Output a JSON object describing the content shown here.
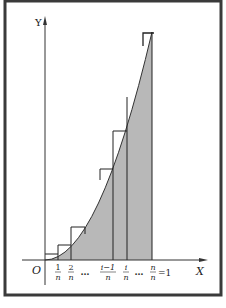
{
  "figure": {
    "axes": {
      "x_label": "X",
      "y_label": "Y",
      "origin_label": "O"
    },
    "ticks": [
      {
        "num": "1",
        "den": "n"
      },
      {
        "num": "2",
        "den": "n"
      },
      {
        "ellipsis": "…"
      },
      {
        "num": "i−1",
        "den": "n"
      },
      {
        "num": "i",
        "den": "n"
      },
      {
        "ellipsis": "…"
      },
      {
        "num": "n",
        "den": "n",
        "suffix": "=1"
      }
    ],
    "colors": {
      "border": "#3a3a3a",
      "shade": "#b8b8b8",
      "line": "#222222"
    }
  }
}
